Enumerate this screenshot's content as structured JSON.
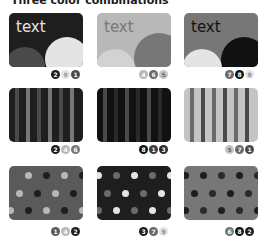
{
  "title": "Three color combinations",
  "colors": {
    "c1": "#4a4a4a",
    "c2": "#1e1e1e",
    "c3": "#b8b8b8",
    "c4": "#9a9a9a",
    "c5": "#c4c4c4",
    "c6": "#777777",
    "c7": "#6a6a6a",
    "c8": "#111111",
    "c9": "#e4e4e4"
  },
  "tiles": [
    {
      "pattern": "text",
      "label": "text",
      "badges": [
        "2",
        "9",
        "1"
      ]
    },
    {
      "pattern": "text",
      "label": "text",
      "badges": [
        "4",
        "6",
        "5"
      ]
    },
    {
      "pattern": "text",
      "label": "text",
      "badges": [
        "7",
        "8",
        "9"
      ]
    },
    {
      "pattern": "stripes",
      "badges": [
        "2",
        "4",
        "6"
      ]
    },
    {
      "pattern": "stripes",
      "badges": [
        "8",
        "1",
        "3"
      ]
    },
    {
      "pattern": "stripes",
      "badges": [
        "5",
        "7",
        "1"
      ]
    },
    {
      "pattern": "dots",
      "badges": [
        "1",
        "4",
        "2"
      ]
    },
    {
      "pattern": "dots",
      "badges": [
        "3",
        "7",
        "9"
      ]
    },
    {
      "pattern": "dots",
      "badges": [
        "6",
        "8",
        "2"
      ]
    }
  ]
}
